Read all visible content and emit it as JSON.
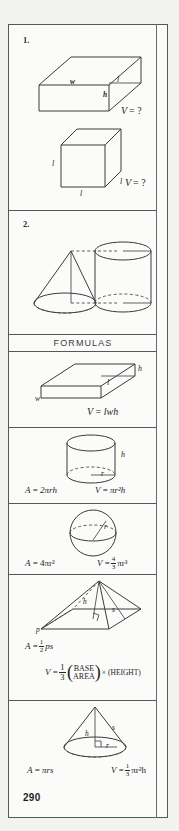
{
  "document": {
    "page_number": "290",
    "formulas_header": "FORMULAS"
  },
  "exercises": [
    {
      "number": "1.",
      "shapes": [
        {
          "name": "rectangular-box",
          "labels": [
            "w",
            "l",
            "h"
          ],
          "question": "V = ?"
        },
        {
          "name": "cube",
          "labels": [
            "l",
            "l",
            "l"
          ],
          "question": "V = ?"
        }
      ]
    },
    {
      "number": "2.",
      "shapes": [
        {
          "name": "cone",
          "labels": []
        },
        {
          "name": "cylinder",
          "labels": []
        }
      ]
    }
  ],
  "formulas": [
    {
      "shape": "rectangular-box",
      "labels": [
        "h",
        "l",
        "w"
      ],
      "area_formula": "",
      "volume_formula": "V = lwh"
    },
    {
      "shape": "cylinder",
      "labels": [
        "h",
        "r"
      ],
      "area_formula": "A = 2πrh",
      "volume_formula": "V = πr²h"
    },
    {
      "shape": "sphere",
      "labels": [
        "r"
      ],
      "area_formula": "A = 4πr²",
      "volume_formula": "V = 4/3 πr³",
      "volume_numerator": "4",
      "volume_denominator": "3"
    },
    {
      "shape": "pyramid",
      "labels": [
        "h",
        "s",
        "p"
      ],
      "area_formula": "A = ½ps",
      "area_numerator": "1",
      "area_denominator": "2",
      "volume_prefix": "V =",
      "volume_numerator": "1",
      "volume_denominator": "3",
      "volume_paren_top": "BASE",
      "volume_paren_bottom": "AREA",
      "volume_suffix": "× (HEIGHT)"
    },
    {
      "shape": "cone",
      "labels": [
        "h",
        "s",
        "r"
      ],
      "area_formula": "A = πrs",
      "volume_formula": "V = 1/3 πr²h",
      "volume_numerator": "1",
      "volume_denominator": "3"
    }
  ],
  "text": {
    "v_equals_a": "V",
    "v_equals_b": "= ?",
    "eq": "=",
    "A": "A",
    "V": "V",
    "lwh": "lwh",
    "two_pi_rh": "2πrh",
    "pi_r2h": "πr²h",
    "four_pi_r2": "4πr²",
    "pi_r3": "πr³",
    "ps": "ps",
    "pi_rs": "πrs",
    "pi_r2h_cone": "πr²h",
    "base": "BASE",
    "area": "AREA",
    "times_height": "× (HEIGHT)"
  },
  "labels": {
    "w": "w",
    "l": "l",
    "h": "h",
    "r": "r",
    "s": "s",
    "p": "p"
  }
}
